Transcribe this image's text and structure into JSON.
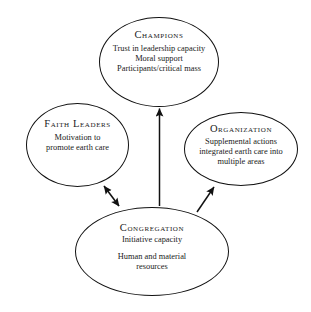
{
  "diagram": {
    "type": "ellipse-node-arrow-diagram",
    "background_color": "#ffffff",
    "stroke_color": "#111111",
    "text_color": "#1a1a1a",
    "nodes": [
      {
        "id": "champions",
        "title": "Champions",
        "lines": [
          "Trust in leadership capacity",
          "Moral support",
          "Participants/critical mass"
        ]
      },
      {
        "id": "faith-leaders",
        "title": "Faith Leaders",
        "lines": [
          "Motivation to",
          "promote earth care"
        ]
      },
      {
        "id": "organization",
        "title": "Organization",
        "lines": [
          "Supplemental actions",
          "integrated earth care into",
          "multiple areas"
        ]
      },
      {
        "id": "congregation",
        "title": "Congregation",
        "lines": [
          "Initiative capacity",
          "Human and material",
          "resources"
        ]
      }
    ],
    "edges": [
      {
        "id": "congregation-to-champions",
        "from": "congregation",
        "to": "champions",
        "direction": "single",
        "label": ""
      },
      {
        "id": "congregation-to-faith-leaders",
        "from": "congregation",
        "to": "faith-leaders",
        "direction": "double",
        "label": ""
      },
      {
        "id": "congregation-to-organization",
        "from": "congregation",
        "to": "organization",
        "direction": "single",
        "label": ""
      }
    ]
  }
}
